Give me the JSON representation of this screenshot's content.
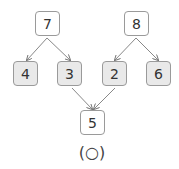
{
  "diagram": {
    "top": [
      {
        "id": "n7",
        "value": "7"
      },
      {
        "id": "n8",
        "value": "8"
      }
    ],
    "middle": [
      {
        "id": "n4",
        "value": "4"
      },
      {
        "id": "n3",
        "value": "3"
      },
      {
        "id": "n2",
        "value": "2"
      },
      {
        "id": "n6",
        "value": "6"
      }
    ],
    "bottom": {
      "id": "n5",
      "value": "5"
    },
    "caption": "(○)",
    "edges": [
      [
        "7",
        "4"
      ],
      [
        "7",
        "3"
      ],
      [
        "8",
        "2"
      ],
      [
        "8",
        "6"
      ],
      [
        "3",
        "5"
      ],
      [
        "2",
        "5"
      ]
    ]
  }
}
